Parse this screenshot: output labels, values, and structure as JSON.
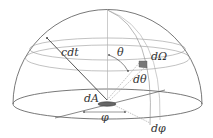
{
  "diagram": {
    "type": "hemisphere-solid-angle",
    "labels": {
      "cdt": "cdt",
      "theta": "θ",
      "d_omega": "dΩ",
      "d_theta": "dθ",
      "dA": "dA",
      "phi": "φ",
      "d_phi": "dφ"
    },
    "colors": {
      "line": "#555555",
      "light_line": "#aaaaaa",
      "patch": "#777777",
      "background": "#ffffff"
    }
  }
}
